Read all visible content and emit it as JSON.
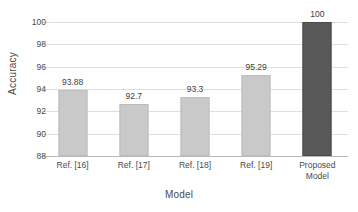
{
  "chart_data": {
    "type": "bar",
    "title": "",
    "xlabel": "Model",
    "ylabel": "Accuracy",
    "categories": [
      "Ref. [16]",
      "Ref. [17]",
      "Ref. [18]",
      "Ref. [19]",
      "Proposed Model"
    ],
    "category_lines": [
      [
        "Ref. [16]"
      ],
      [
        "Ref. [17]"
      ],
      [
        "Ref. [18]"
      ],
      [
        "Ref. [19]"
      ],
      [
        "Proposed",
        "Model"
      ]
    ],
    "values": [
      93.88,
      92.7,
      93.3,
      95.29,
      100
    ],
    "value_labels": [
      "93.88",
      "92.7",
      "93.3",
      "95.29",
      "100"
    ],
    "ylim": [
      88,
      100
    ],
    "yticks": [
      88,
      90,
      92,
      94,
      96,
      98,
      100
    ],
    "ytick_labels": [
      "88",
      "90",
      "92",
      "94",
      "96",
      "98",
      "100"
    ],
    "grid": true,
    "legend": false,
    "bar_colors": [
      "#c9c9c9",
      "#c9c9c9",
      "#c9c9c9",
      "#c9c9c9",
      "#595959"
    ],
    "highlight_index": 4,
    "colors": {
      "bar_default": "#c9c9c9",
      "bar_highlight": "#595959",
      "gridline": "#dedede",
      "axis": "#b9b9b9",
      "text": "#4a4a4a",
      "background": "#ffffff"
    }
  }
}
